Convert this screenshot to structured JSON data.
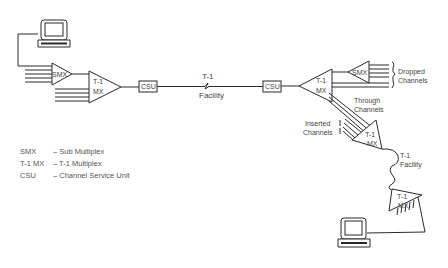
{
  "diagram": {
    "devices": {
      "smx_left": "SMX",
      "t1mx_left_line1": "T-1",
      "t1mx_left_line2": "MX",
      "csu_left": "CSU",
      "csu_right": "CSU",
      "t1mx_mid_line1": "T-1",
      "t1mx_mid_line2": "MX",
      "smx_right": "SMX",
      "t1mx_lower_line1": "T-1",
      "t1mx_lower_line2": "MX",
      "t1mx_bottom_line1": "T-1",
      "t1mx_bottom_line2": "MX"
    },
    "links": {
      "facility_top_line1": "T-1",
      "facility_top_line2": "Facility",
      "facility_lower_line1": "T-1",
      "facility_lower_line2": "Facility"
    },
    "annotations": {
      "dropped_line1": "Dropped",
      "dropped_line2": "Channels",
      "through_line1": "Through",
      "through_line2": "Channels",
      "inserted_line1": "Inserted",
      "inserted_line2": "Channels"
    },
    "terminals": [
      "terminal-top-left",
      "terminal-bottom-right"
    ]
  },
  "legend": [
    {
      "abbr": "SMX",
      "desc": "– Sub Multiplex"
    },
    {
      "abbr": "T-1 MX",
      "desc": "– T-1 Multiplex"
    },
    {
      "abbr": "CSU",
      "desc": "– Channel Service Unit"
    }
  ]
}
